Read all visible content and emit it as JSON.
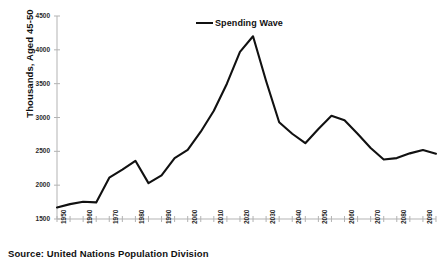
{
  "figure": {
    "clipped_title": "",
    "source_note": "Source: United Nations Population Division",
    "legend_label": "Spending Wave",
    "y_axis_title": "Thousands, Aged 45-50"
  },
  "chart_data": {
    "type": "line",
    "title": "",
    "xlabel": "",
    "ylabel": "Thousands, Aged 45-50",
    "xlim": [
      1950,
      2095
    ],
    "ylim": [
      1500,
      4500
    ],
    "ytick_labels": [
      "1500",
      "2000",
      "2500",
      "3000",
      "3500",
      "4000",
      "4500"
    ],
    "yticks": [
      1500,
      2000,
      2500,
      3000,
      3500,
      4000,
      4500
    ],
    "xtick_labels": [
      "1950",
      "1960",
      "1970",
      "1980",
      "1990",
      "2000",
      "2010",
      "2020",
      "2030",
      "2040",
      "2050",
      "2060",
      "2070",
      "2080",
      "2090"
    ],
    "xticks": [
      1950,
      1960,
      1970,
      1980,
      1990,
      2000,
      2010,
      2020,
      2030,
      2040,
      2050,
      2060,
      2070,
      2080,
      2090
    ],
    "minor_tick_interval": 5,
    "grid": false,
    "legend_position": "top-center",
    "line_color": "#111111",
    "axis_color": "#aaaaaa",
    "series": [
      {
        "name": "Spending Wave",
        "x": [
          1950,
          1955,
          1960,
          1965,
          1970,
          1975,
          1980,
          1985,
          1990,
          1995,
          2000,
          2005,
          2010,
          2015,
          2020,
          2025,
          2030,
          2035,
          2040,
          2045,
          2050,
          2055,
          2060,
          2065,
          2070,
          2075,
          2080,
          2085,
          2090,
          2095
        ],
        "values": [
          1670,
          1720,
          1755,
          1745,
          2110,
          2230,
          2360,
          2030,
          2145,
          2400,
          2520,
          2790,
          3100,
          3500,
          3970,
          4200,
          3540,
          2930,
          2760,
          2620,
          2830,
          3025,
          2960,
          2760,
          2550,
          2380,
          2400,
          2470,
          2520,
          2465
        ]
      }
    ],
    "annotations": {
      "peak_year": 2025,
      "peak_value": 4200,
      "start_value": 1670,
      "end_value": 2465
    }
  }
}
